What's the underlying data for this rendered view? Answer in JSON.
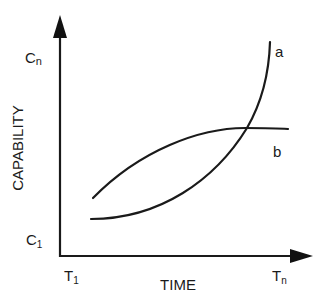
{
  "diagram": {
    "y_axis": {
      "label": "CAPABILITY",
      "top_label": "C",
      "top_sub": "n",
      "bottom_label": "C",
      "bottom_sub": "1"
    },
    "x_axis": {
      "label": "TIME",
      "start_label": "T",
      "start_sub": "1",
      "end_label": "T",
      "end_sub": "n"
    },
    "curves": [
      {
        "name": "a",
        "label": "a",
        "shape": "exponential rise, starts low and rises steeply at the end"
      },
      {
        "name": "b",
        "label": "b",
        "shape": "concave rise, starts higher and levels off"
      }
    ]
  }
}
